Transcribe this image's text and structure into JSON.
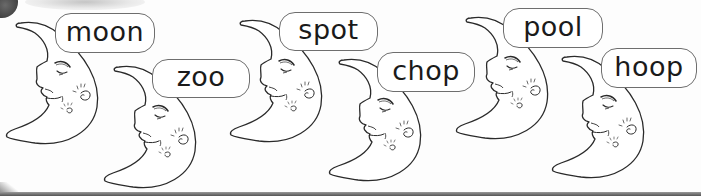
{
  "worksheet": {
    "colors": {
      "outline": "#2a2a2a",
      "bubble_border": "#6e6e6e",
      "text": "#1a1a1a",
      "background": "#fdfdfd",
      "bottom_bar": "#555555"
    },
    "items": [
      {
        "word": "moon",
        "icon": "crescent-moon-face-icon"
      },
      {
        "word": "zoo",
        "icon": "crescent-moon-face-icon"
      },
      {
        "word": "spot",
        "icon": "crescent-moon-face-icon"
      },
      {
        "word": "chop",
        "icon": "crescent-moon-face-icon"
      },
      {
        "word": "pool",
        "icon": "crescent-moon-face-icon"
      },
      {
        "word": "hoop",
        "icon": "crescent-moon-face-icon"
      }
    ]
  }
}
